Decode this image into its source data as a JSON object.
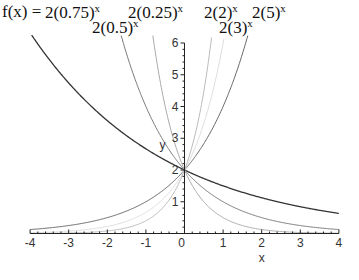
{
  "title": {
    "prefix": "f(x) =",
    "labels": [
      {
        "base": "2(0.75)",
        "exp": "x",
        "left": 45,
        "top": 3
      },
      {
        "base": "2(0.25)",
        "exp": "x",
        "left": 128,
        "top": 3
      },
      {
        "base": "2(0.5)",
        "exp": "x",
        "left": 92,
        "top": 18
      },
      {
        "base": "2(2)",
        "exp": "x",
        "left": 204,
        "top": 3
      },
      {
        "base": "2(5)",
        "exp": "x",
        "left": 252,
        "top": 3
      },
      {
        "base": "2(3)",
        "exp": "x",
        "left": 219,
        "top": 18
      }
    ]
  },
  "chart_data": {
    "type": "line",
    "xlabel": "x",
    "ylabel": "y",
    "xlim": [
      -4,
      4
    ],
    "ylim": [
      0,
      6
    ],
    "x_ticks": [
      -4,
      -3,
      -2,
      -1,
      0,
      1,
      2,
      3,
      4
    ],
    "y_ticks": [
      1,
      2,
      3,
      4,
      5,
      6
    ],
    "grid": false,
    "legend": "none (labels placed above plot)",
    "series": [
      {
        "name": "2(0.75)^x",
        "base": 0.75,
        "color": "#333333",
        "width": 1.3
      },
      {
        "name": "2(0.5)^x",
        "base": 0.5,
        "color": "#777777",
        "width": 1.0
      },
      {
        "name": "2(0.25)^x",
        "base": 0.25,
        "color": "#aaaaaa",
        "width": 1.0
      },
      {
        "name": "2(2)^x",
        "base": 2,
        "color": "#666666",
        "width": 1.0
      },
      {
        "name": "2(3)^x",
        "base": 3,
        "color": "#dddddd",
        "width": 1.0
      },
      {
        "name": "2(5)^x",
        "base": 5,
        "color": "#bbbbbb",
        "width": 1.0
      }
    ],
    "sample_points": {
      "2(0.75)^x": [
        [
          -4,
          6.32
        ],
        [
          -2,
          3.56
        ],
        [
          0,
          2
        ],
        [
          2,
          1.125
        ],
        [
          4,
          0.63
        ]
      ],
      "2(0.5)^x": [
        [
          -1.58,
          6
        ],
        [
          -1,
          4
        ],
        [
          0,
          2
        ],
        [
          2,
          0.5
        ],
        [
          4,
          0.125
        ]
      ],
      "2(0.25)^x": [
        [
          -0.79,
          6
        ],
        [
          0,
          2
        ],
        [
          1,
          0.5
        ],
        [
          4,
          0.008
        ]
      ],
      "2(2)^x": [
        [
          -4,
          0.125
        ],
        [
          -2,
          0.5
        ],
        [
          0,
          2
        ],
        [
          1,
          4
        ],
        [
          1.58,
          6
        ]
      ],
      "2(3)^x": [
        [
          -4,
          0.025
        ],
        [
          -1,
          0.67
        ],
        [
          0,
          2
        ],
        [
          1,
          6
        ]
      ],
      "2(5)^x": [
        [
          -4,
          0.003
        ],
        [
          -1,
          0.4
        ],
        [
          0,
          2
        ],
        [
          0.68,
          6
        ]
      ]
    }
  },
  "plot": {
    "origin_x": 184.5,
    "origin_y": 233.5,
    "px_per_x": 38.6,
    "px_per_y": 31.75
  }
}
